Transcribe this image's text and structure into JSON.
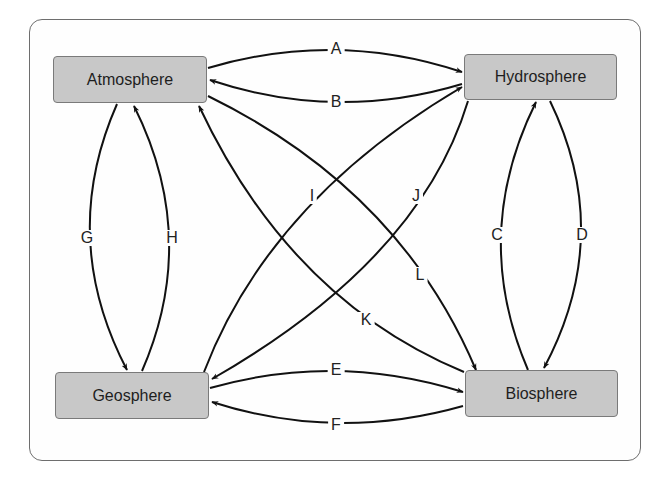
{
  "diagram": {
    "type": "cycle-interaction-diagram",
    "nodes": [
      {
        "id": "atmosphere",
        "label": "Atmosphere"
      },
      {
        "id": "hydrosphere",
        "label": "Hydrosphere"
      },
      {
        "id": "geosphere",
        "label": "Geosphere"
      },
      {
        "id": "biosphere",
        "label": "Biosphere"
      }
    ],
    "edges": [
      {
        "label": "A",
        "from": "atmosphere",
        "to": "hydrosphere"
      },
      {
        "label": "B",
        "from": "hydrosphere",
        "to": "atmosphere"
      },
      {
        "label": "C",
        "from": "biosphere",
        "to": "hydrosphere"
      },
      {
        "label": "D",
        "from": "hydrosphere",
        "to": "biosphere"
      },
      {
        "label": "E",
        "from": "geosphere",
        "to": "biosphere"
      },
      {
        "label": "F",
        "from": "biosphere",
        "to": "geosphere"
      },
      {
        "label": "G",
        "from": "atmosphere",
        "to": "geosphere"
      },
      {
        "label": "H",
        "from": "geosphere",
        "to": "atmosphere"
      },
      {
        "label": "I",
        "from": "geosphere",
        "to": "hydrosphere"
      },
      {
        "label": "J",
        "from": "hydrosphere",
        "to": "geosphere"
      },
      {
        "label": "K",
        "from": "biosphere",
        "to": "atmosphere"
      },
      {
        "label": "L",
        "from": "atmosphere",
        "to": "biosphere"
      }
    ],
    "colors": {
      "node_fill": "#c8c8c8",
      "node_border": "#7a7a7a",
      "line": "#111111",
      "frame": "#6e6e6e"
    }
  }
}
